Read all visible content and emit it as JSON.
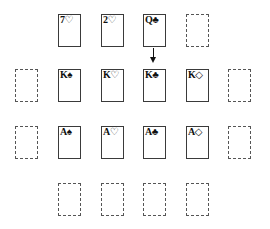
{
  "game": {
    "rows": [
      {
        "name": "top-row",
        "slots": [
          {
            "id": "r1c1",
            "type": "card",
            "rank": "7",
            "suit": "♡",
            "suit_name": "hearts",
            "x": 58,
            "y": 14
          },
          {
            "id": "r1c2",
            "type": "card",
            "rank": "2",
            "suit": "♡",
            "suit_name": "hearts",
            "x": 101,
            "y": 14
          },
          {
            "id": "r1c3",
            "type": "card",
            "rank": "Q",
            "suit": "♣",
            "suit_name": "clubs",
            "x": 143,
            "y": 14
          },
          {
            "id": "r1c4",
            "type": "empty",
            "x": 186,
            "y": 14
          }
        ]
      },
      {
        "name": "kings-row",
        "slots": [
          {
            "id": "r2c0",
            "type": "empty",
            "x": 15,
            "y": 69
          },
          {
            "id": "r2c1",
            "type": "card",
            "rank": "K",
            "suit": "♠",
            "suit_name": "spades",
            "x": 58,
            "y": 69
          },
          {
            "id": "r2c2",
            "type": "card",
            "rank": "K",
            "suit": "♡",
            "suit_name": "hearts",
            "x": 101,
            "y": 69
          },
          {
            "id": "r2c3",
            "type": "card",
            "rank": "K",
            "suit": "♣",
            "suit_name": "clubs",
            "x": 143,
            "y": 69
          },
          {
            "id": "r2c4",
            "type": "card",
            "rank": "K",
            "suit": "◇",
            "suit_name": "diamonds",
            "x": 186,
            "y": 69
          },
          {
            "id": "r2c5",
            "type": "empty",
            "x": 228,
            "y": 69
          }
        ]
      },
      {
        "name": "aces-row",
        "slots": [
          {
            "id": "r3c0",
            "type": "empty",
            "x": 15,
            "y": 126
          },
          {
            "id": "r3c1",
            "type": "card",
            "rank": "A",
            "suit": "♠",
            "suit_name": "spades",
            "x": 58,
            "y": 126
          },
          {
            "id": "r3c2",
            "type": "card",
            "rank": "A",
            "suit": "♡",
            "suit_name": "hearts",
            "x": 101,
            "y": 126
          },
          {
            "id": "r3c3",
            "type": "card",
            "rank": "A",
            "suit": "♣",
            "suit_name": "clubs",
            "x": 143,
            "y": 126
          },
          {
            "id": "r3c4",
            "type": "card",
            "rank": "A",
            "suit": "◇",
            "suit_name": "diamonds",
            "x": 186,
            "y": 126
          },
          {
            "id": "r3c5",
            "type": "empty",
            "x": 228,
            "y": 126
          }
        ]
      },
      {
        "name": "bottom-row",
        "slots": [
          {
            "id": "r4c1",
            "type": "empty",
            "x": 58,
            "y": 183
          },
          {
            "id": "r4c2",
            "type": "empty",
            "x": 101,
            "y": 183
          },
          {
            "id": "r4c3",
            "type": "empty",
            "x": 143,
            "y": 183
          },
          {
            "id": "r4c4",
            "type": "empty",
            "x": 186,
            "y": 183
          }
        ]
      }
    ],
    "move_arrow": {
      "from": "Q♣",
      "to": "K♣",
      "direction": "down"
    }
  }
}
